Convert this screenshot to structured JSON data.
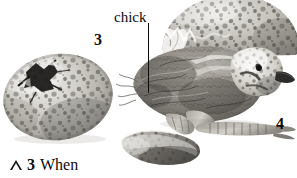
{
  "figure": {
    "kind": "photograph",
    "background_color": "#ffffff",
    "ink_color": "#0b0b0b",
    "annotations": {
      "chick_label": "chick",
      "number_left": "3",
      "number_right": "4"
    },
    "caption": {
      "marker_icon": "triangle-outline-icon",
      "number": "3",
      "text": "When"
    },
    "leader_line": {
      "name": "chick-leader-line",
      "color": "#0e0e0e"
    },
    "objects": [
      {
        "name": "intact-pipped-egg",
        "description": "large speckled egg, left, with dark star-shaped pip hole and radiating cracks on upper-left"
      },
      {
        "name": "broken-eggshell-dome",
        "description": "speckled eggshell cap, upper right, jagged broken rim facing left"
      },
      {
        "name": "chick-body",
        "description": "wet downy mottled grey-brown chick, centre"
      },
      {
        "name": "chick-head",
        "description": "pale speckled head with dark beak pointing right"
      },
      {
        "name": "chick-legs",
        "description": "scaly legs and toes extending right"
      },
      {
        "name": "eggshell-fragment",
        "description": "curved speckled shell shard, lower centre"
      }
    ],
    "palette": {
      "shell_light": "#d9d7d2",
      "shell_mid": "#b3b0aa",
      "speckle_dark": "#5a5854",
      "speckle_darkest": "#2e2d2b",
      "down_mid": "#8f8b84",
      "down_dark": "#4a4844",
      "highlight": "#f2f1ee"
    }
  }
}
